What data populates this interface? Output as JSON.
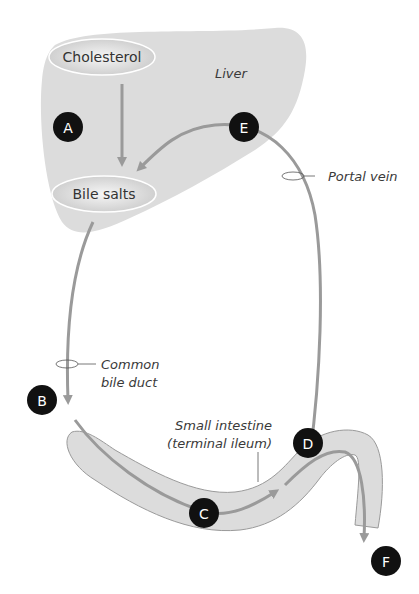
{
  "diagram": {
    "nodes": {
      "cholesterol": "Cholesterol",
      "bile_salts": "Bile salts"
    },
    "labels": {
      "liver": "Liver",
      "portal_vein": "Portal vein",
      "common_bile_duct_1": "Common",
      "common_bile_duct_2": "bile duct",
      "small_intestine_1": "Small intestine",
      "small_intestine_2": "(terminal ileum)"
    },
    "markers": {
      "A": "A",
      "B": "B",
      "C": "C",
      "D": "D",
      "E": "E",
      "F": "F"
    },
    "colors": {
      "organ_fill": "#dcdcdc",
      "arrow": "#9a9a9a",
      "marker": "#111111",
      "marker_text": "#ffffff"
    }
  }
}
